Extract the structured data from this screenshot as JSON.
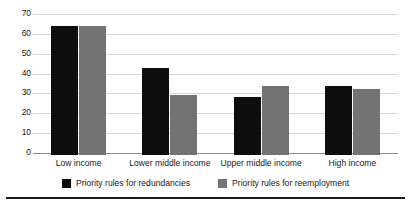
{
  "chart_data": {
    "type": "bar",
    "title": "",
    "subtitle": "",
    "xlabel": "",
    "ylabel": "",
    "ylim": [
      0,
      70
    ],
    "yticks": [
      0,
      10,
      20,
      30,
      40,
      50,
      60,
      70
    ],
    "grid": "horizontal",
    "legend_position": "bottom-center",
    "categories": [
      "Low income",
      "Lower middle income",
      "Upper middle income",
      "High income"
    ],
    "series": [
      {
        "name": "Priority rules for redundancies",
        "color": "#0d0d0d",
        "values": [
          65,
          44,
          29,
          35
        ]
      },
      {
        "name": "Priority rules for reemployment",
        "color": "#737373",
        "values": [
          65,
          30,
          35,
          33
        ]
      }
    ]
  },
  "axis": {
    "y_tick_labels": [
      "70",
      "60",
      "50",
      "40",
      "30",
      "20",
      "10",
      "0"
    ]
  },
  "legend": {
    "entries": [
      {
        "label": "Priority rules for redundancies",
        "swatch": "black-square-swatch"
      },
      {
        "label": "Priority rules for reemployment",
        "swatch": "gray-square-swatch"
      }
    ]
  },
  "colors": {
    "series_0": "#0d0d0d",
    "series_1": "#737373",
    "gridline": "#d9d9d9",
    "axis": "#8c8c8c",
    "text": "#1a1a1a",
    "rule": "#1a1a1a",
    "background": "#ffffff"
  }
}
